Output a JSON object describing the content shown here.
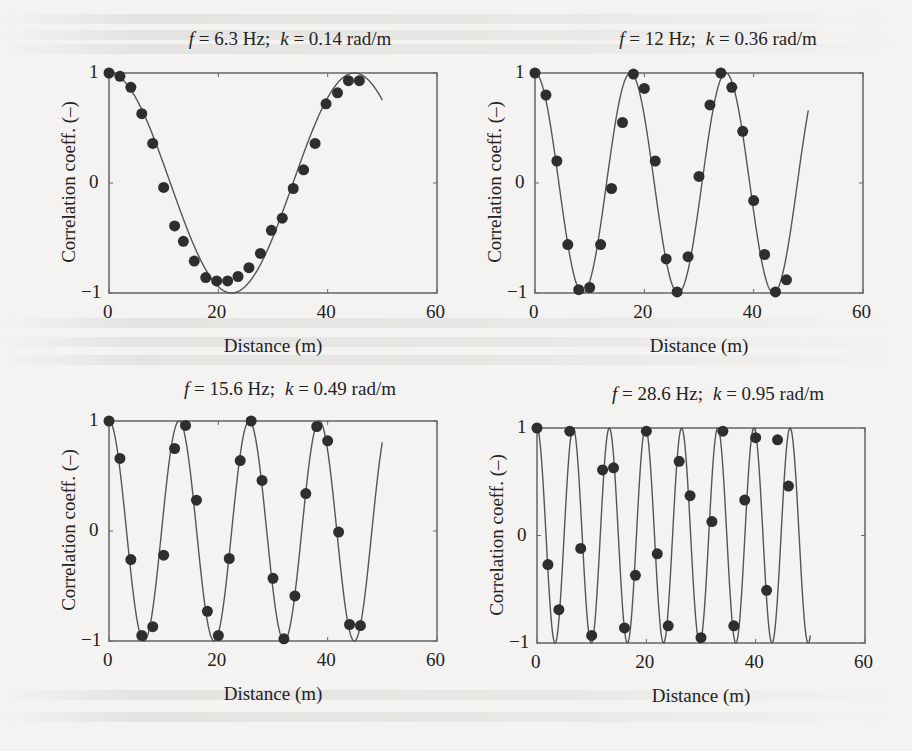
{
  "figure": {
    "y_axis_label": "Correlation coeff. (–)",
    "x_axis_label": "Distance (m)",
    "y_ticks": [
      "1",
      "0",
      "−1"
    ],
    "x_ticks": [
      "0",
      "20",
      "40",
      "60"
    ],
    "colors": {
      "line": "#555555",
      "marker": "#2e2e2e",
      "frame": "#666666",
      "background": "#f4f3f1"
    }
  },
  "panels": [
    {
      "title_f_sym": "f",
      "title_f_val": " = 6.3 Hz;",
      "title_k_sym": "k",
      "title_k_val": " = 0.14 rad/m"
    },
    {
      "title_f_sym": "f",
      "title_f_val": " = 12 Hz;",
      "title_k_sym": "k",
      "title_k_val": " = 0.36 rad/m"
    },
    {
      "title_f_sym": "f",
      "title_f_val": " = 15.6 Hz;",
      "title_k_sym": "k",
      "title_k_val": " = 0.49 rad/m"
    },
    {
      "title_f_sym": "f",
      "title_f_val": " = 28.6 Hz;",
      "title_k_sym": "k",
      "title_k_val": " = 0.95 rad/m"
    }
  ],
  "chart_data": [
    {
      "type": "scatter",
      "title": "f = 6.3 Hz; k = 0.14 rad/m",
      "xlabel": "Distance (m)",
      "ylabel": "Correlation coeff. (–)",
      "xlim": [
        0,
        60
      ],
      "ylim": [
        -1,
        1
      ],
      "grid": false,
      "x_ticks": [
        0,
        20,
        40,
        60
      ],
      "y_ticks": [
        -1,
        0,
        1
      ],
      "fit_curve": {
        "type": "line",
        "equation": "cos(k*x)",
        "k": 0.14,
        "x_range": [
          0,
          50
        ]
      },
      "series": [
        {
          "name": "measured",
          "x": [
            0,
            2,
            4,
            6,
            8,
            10,
            12,
            13.6,
            15.6,
            17.7,
            19.7,
            21.7,
            23.6,
            25.6,
            27.7,
            29.7,
            31.7,
            33.7,
            35.6,
            37.7,
            39.7,
            41.8,
            43.8,
            45.8
          ],
          "y": [
            1.0,
            0.97,
            0.87,
            0.63,
            0.36,
            -0.04,
            -0.39,
            -0.53,
            -0.71,
            -0.86,
            -0.89,
            -0.89,
            -0.85,
            -0.77,
            -0.64,
            -0.43,
            -0.32,
            -0.05,
            0.12,
            0.36,
            0.72,
            0.82,
            0.93,
            0.93
          ]
        }
      ]
    },
    {
      "type": "scatter",
      "title": "f = 12 Hz; k = 0.36 rad/m",
      "xlabel": "Distance (m)",
      "ylabel": "Correlation coeff. (–)",
      "xlim": [
        0,
        60
      ],
      "ylim": [
        -1,
        1
      ],
      "grid": false,
      "x_ticks": [
        0,
        20,
        40,
        60
      ],
      "y_ticks": [
        -1,
        0,
        1
      ],
      "fit_curve": {
        "type": "line",
        "equation": "cos(k*x)",
        "k": 0.36,
        "x_range": [
          0,
          50
        ]
      },
      "series": [
        {
          "name": "measured",
          "x": [
            0,
            2,
            4,
            6,
            8,
            10,
            12,
            14,
            16,
            18,
            20,
            22,
            24,
            26,
            28,
            30,
            32,
            34,
            36,
            38,
            40,
            42,
            44,
            46
          ],
          "y": [
            1.0,
            0.8,
            0.2,
            -0.56,
            -0.97,
            -0.95,
            -0.56,
            -0.05,
            0.55,
            0.99,
            0.86,
            0.2,
            -0.69,
            -0.99,
            -0.67,
            0.06,
            0.71,
            1.0,
            0.87,
            0.47,
            -0.16,
            -0.65,
            -0.99,
            -0.88
          ]
        }
      ]
    },
    {
      "type": "scatter",
      "title": "f = 15.6 Hz; k = 0.49 rad/m",
      "xlabel": "Distance (m)",
      "ylabel": "Correlation coeff. (–)",
      "xlim": [
        0,
        60
      ],
      "ylim": [
        -1,
        1
      ],
      "grid": false,
      "x_ticks": [
        0,
        20,
        40,
        60
      ],
      "y_ticks": [
        -1,
        0,
        1
      ],
      "fit_curve": {
        "type": "line",
        "equation": "cos(k*x)",
        "k": 0.49,
        "x_range": [
          0,
          50
        ]
      },
      "series": [
        {
          "name": "measured",
          "x": [
            0,
            2,
            4,
            6,
            8,
            10,
            12,
            14,
            16,
            18,
            20,
            22,
            24,
            26,
            28,
            30,
            32,
            34,
            36,
            38,
            40,
            42,
            44,
            46
          ],
          "y": [
            1.0,
            0.66,
            -0.26,
            -0.95,
            -0.87,
            -0.22,
            0.75,
            0.96,
            0.28,
            -0.73,
            -0.95,
            -0.25,
            0.64,
            1.0,
            0.46,
            -0.43,
            -0.98,
            -0.59,
            0.34,
            0.95,
            0.82,
            -0.01,
            -0.85,
            -0.86
          ]
        }
      ]
    },
    {
      "type": "scatter",
      "title": "f = 28.6 Hz; k = 0.95 rad/m",
      "xlabel": "Distance (m)",
      "ylabel": "Correlation coeff. (–)",
      "xlim": [
        0,
        60
      ],
      "ylim": [
        -1,
        1
      ],
      "grid": false,
      "x_ticks": [
        0,
        20,
        40,
        60
      ],
      "y_ticks": [
        -1,
        0,
        1
      ],
      "fit_curve": {
        "type": "line",
        "equation": "cos(k*x)",
        "k": 0.95,
        "x_range": [
          0,
          50
        ]
      },
      "series": [
        {
          "name": "measured",
          "x": [
            0,
            2,
            4,
            6,
            8,
            10,
            12,
            14,
            16,
            18,
            20,
            22,
            24,
            26,
            28,
            30,
            32,
            34,
            36,
            38,
            40,
            42,
            44,
            46
          ],
          "y": [
            1.0,
            -0.27,
            -0.69,
            0.97,
            -0.12,
            -0.93,
            0.61,
            0.63,
            -0.86,
            -0.37,
            0.97,
            -0.17,
            -0.84,
            0.69,
            0.37,
            -0.95,
            0.13,
            0.97,
            -0.84,
            0.33,
            0.91,
            -0.51,
            0.89,
            0.46
          ]
        }
      ]
    }
  ]
}
